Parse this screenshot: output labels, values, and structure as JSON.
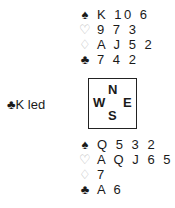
{
  "lead": {
    "suit_symbol": "♣",
    "text": "K led"
  },
  "north": {
    "spades": {
      "symbol": "♠",
      "cards": "K 10 6"
    },
    "hearts": {
      "symbol": "♡",
      "cards": "9 7 3"
    },
    "diamonds": {
      "symbol": "♢",
      "cards": "A J 5 2"
    },
    "clubs": {
      "symbol": "♣",
      "cards": "7 4 2"
    }
  },
  "compass": {
    "n": "N",
    "w": "W",
    "e": "E",
    "s": "S"
  },
  "south": {
    "spades": {
      "symbol": "♠",
      "cards": "Q 5 3 2"
    },
    "hearts": {
      "symbol": "♡",
      "cards": "A Q J 6 5 2"
    },
    "diamonds": {
      "symbol": "♢",
      "cards": "7"
    },
    "clubs": {
      "symbol": "♣",
      "cards": "A 6"
    }
  },
  "colors": {
    "text": "#1a1a1a",
    "outline_suit": "#b8b8b8",
    "background": "#ffffff"
  }
}
